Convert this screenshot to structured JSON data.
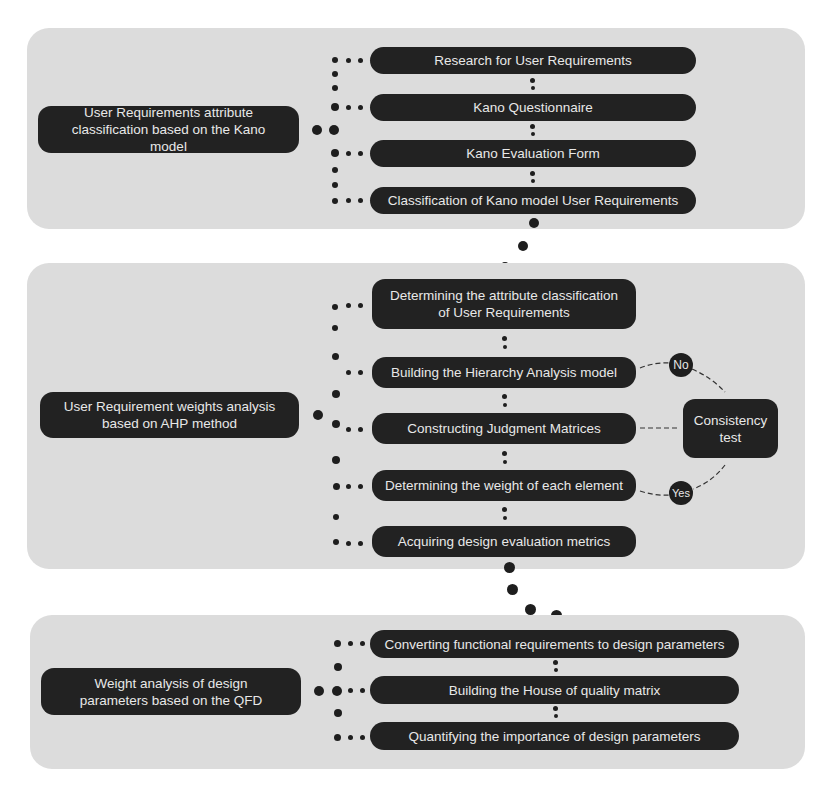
{
  "stages": [
    {
      "title": "User Requirements attribute classification based on the Kano model",
      "steps": [
        "Research for User Requirements",
        "Kano Questionnaire",
        "Kano Evaluation Form",
        "Classification of Kano model User Requirements"
      ]
    },
    {
      "title": "User Requirement weights analysis based on AHP method",
      "steps": [
        "Determining the attribute classification of User Requirements",
        "Building the Hierarchy Analysis model",
        "Constructing Judgment Matrices",
        "Determining the weight of each element",
        "Acquiring design evaluation metrics"
      ],
      "check": {
        "label": "Consistency test",
        "no_label": "No",
        "yes_label": "Yes"
      }
    },
    {
      "title": "Weight analysis of design parameters based on the QFD",
      "steps": [
        "Converting functional requirements to design parameters",
        "Building the House of quality matrix",
        "Quantifying the importance of design parameters"
      ]
    }
  ],
  "colors": {
    "panel": "#dcdcdc",
    "node": "#222222",
    "node_text": "#e8e8e8",
    "background": "#ffffff"
  }
}
